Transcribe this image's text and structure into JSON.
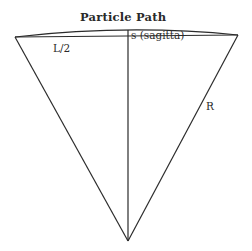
{
  "diagram": {
    "title": "Particle Path",
    "labels": {
      "half_chord": "L/2",
      "sagitta": "s (sagitta)",
      "radius": "R"
    },
    "colors": {
      "line": "#2b2b2b",
      "text": "#2a2a2a",
      "background": "#ffffff"
    }
  }
}
